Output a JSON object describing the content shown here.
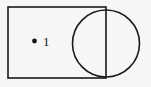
{
  "figure": {
    "background_color": "#f7f6f4",
    "stroke_color": "#1a1a1a",
    "canvas": {
      "width": 151,
      "height": 87
    },
    "rectangle": {
      "name": "rectangle",
      "x": 8,
      "y": 7,
      "width": 98,
      "height": 71,
      "stroke_width": 1.6
    },
    "circle": {
      "name": "circle",
      "cx": 106,
      "cy": 43.5,
      "r": 33.5,
      "stroke_width": 1.6
    },
    "point": {
      "name": "point-1",
      "label": "1",
      "dot_cx": 34.5,
      "dot_cy": 41,
      "dot_r": 2.4,
      "label_x": 43,
      "label_y": 45.5
    }
  }
}
